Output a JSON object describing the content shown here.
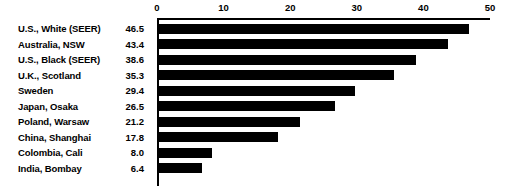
{
  "chart_data": {
    "type": "bar",
    "orientation": "horizontal",
    "title": "",
    "subtitle": "",
    "xlabel": "",
    "ylabel": "",
    "xlim": [
      0,
      50
    ],
    "xticks": [
      0,
      10,
      20,
      30,
      40,
      50
    ],
    "grid": false,
    "legend": null,
    "bar_color": "#000000",
    "background_color": "#ffffff",
    "axis_color": "#000000",
    "categories": [
      "U.S., White (SEER)",
      "Australia, NSW",
      "U.S., Black (SEER)",
      "U.K., Scotland",
      "Sweden",
      "Japan, Osaka",
      "Poland, Warsaw",
      "China, Shanghai",
      "Colombia, Cali",
      "India, Bombay"
    ],
    "values": [
      46.5,
      43.4,
      38.6,
      35.3,
      29.4,
      26.5,
      21.2,
      17.8,
      8.0,
      6.4
    ],
    "value_labels": [
      "46.5",
      "43.4",
      "38.6",
      "35.3",
      "29.4",
      "26.5",
      "21.2",
      "17.8",
      "8.0",
      "6.4"
    ],
    "tick_labels": [
      "0",
      "10",
      "20",
      "30",
      "40",
      "50"
    ]
  }
}
